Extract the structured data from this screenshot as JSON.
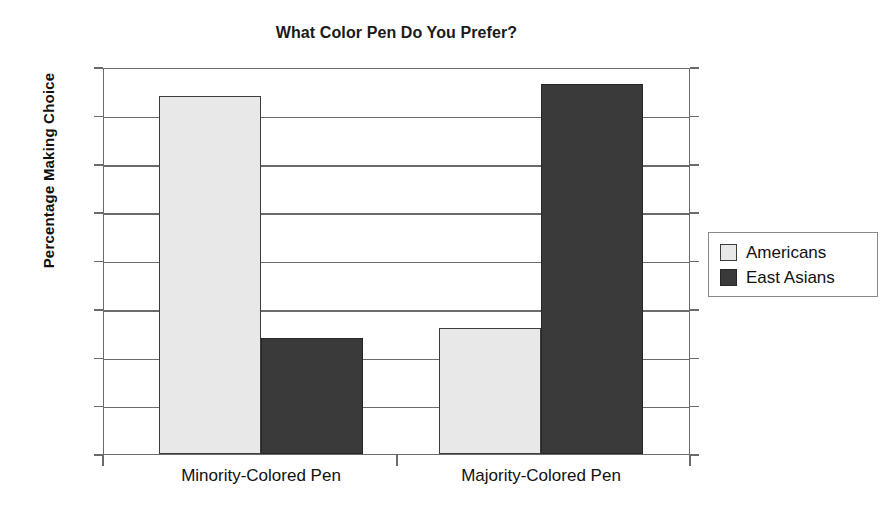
{
  "chart_data": {
    "type": "bar",
    "title": "What Color Pen Do You Prefer?",
    "xlabel": "",
    "ylabel": "Percentage Making Choice",
    "categories": [
      "Minority-Colored Pen",
      "Majority-Colored Pen"
    ],
    "series": [
      {
        "name": "Americans",
        "color": "#e8e8e8",
        "values": [
          74,
          26
        ]
      },
      {
        "name": "East Asians",
        "color": "#3a3a3a",
        "values": [
          24,
          76.5
        ]
      }
    ],
    "ylim": [
      0,
      80
    ],
    "yticks": [
      0,
      10,
      20,
      30,
      40,
      50,
      60,
      70,
      80
    ],
    "ytick_labels": [
      "0",
      "10",
      "20",
      "30",
      "40",
      "50",
      "60",
      "70",
      "80"
    ],
    "grid": "horizontal",
    "legend_position": "right-outside",
    "background": "#ffffff",
    "axis_color": "#6b6b6b",
    "bar_edge_color": "#3d3d3d"
  }
}
